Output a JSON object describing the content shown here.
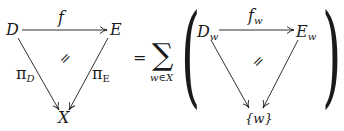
{
  "left_diagram": {
    "nodes": {
      "D": "D",
      "E": "E",
      "X": "X"
    },
    "arrows": {
      "top": {
        "label": "f"
      },
      "left": {
        "label_main": "π",
        "label_sub": "D"
      },
      "right": {
        "label_main": "π",
        "label_sub": "E"
      }
    },
    "cell": "="
  },
  "equals": "=",
  "sum": {
    "symbol": "∑",
    "index": "w∈X"
  },
  "right_diagram": {
    "nodes": {
      "D_main": "D",
      "D_sub": "w",
      "E_main": "E",
      "E_sub": "w",
      "X": "{w}"
    },
    "arrows": {
      "top": {
        "label_main": "f",
        "label_sub": "w"
      }
    },
    "cell": "="
  },
  "parens": {
    "open": "(",
    "close": ")"
  },
  "period": "."
}
